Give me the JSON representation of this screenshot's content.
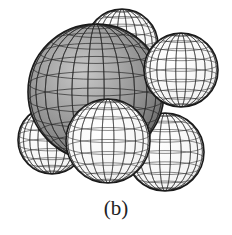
{
  "figure": {
    "caption": "(b)",
    "colors": {
      "central_fill": "#9a9a9a",
      "outer_fill": "#ffffff",
      "mesh": "#2a2a2a"
    },
    "spheres": [
      {
        "role": "back-top",
        "cx": 122,
        "cy": 45,
        "r": 36,
        "fill": "#e6e6e6"
      },
      {
        "role": "back-left",
        "cx": 52,
        "cy": 140,
        "r": 34,
        "fill": "#f2f2f2"
      },
      {
        "role": "back-right",
        "cx": 165,
        "cy": 152,
        "r": 39,
        "fill": "#f2f2f2"
      },
      {
        "role": "central",
        "cx": 96,
        "cy": 92,
        "r": 68,
        "fill": "#9a9a9a"
      },
      {
        "role": "upper-right",
        "cx": 181,
        "cy": 70,
        "r": 37,
        "fill": "#ffffff"
      },
      {
        "role": "bottom-center",
        "cx": 108,
        "cy": 141,
        "r": 42,
        "fill": "#ffffff"
      }
    ]
  }
}
